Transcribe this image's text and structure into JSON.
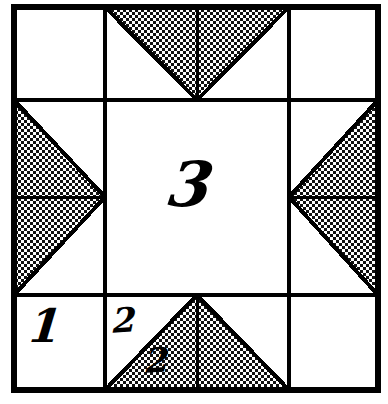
{
  "figure": {
    "block_name": "Ohio Star",
    "ink_color": "#000000",
    "background_color": "#ffffff",
    "fabric_shade_color": "#d9d9d9",
    "outline_width_px": 5,
    "grid_line_width_px": 3,
    "block_bounds": {
      "x": 14,
      "y": 7,
      "width": 364,
      "height": 383
    },
    "grid": {
      "columns_x": [
        14,
        105,
        289,
        378
      ],
      "rows_y": [
        7,
        100,
        295,
        390
      ],
      "column_count": 3,
      "row_count": 3
    }
  },
  "labels": [
    {
      "id": "piece-1",
      "text": "1",
      "cell": "bottom-left-corner-square",
      "shaded": false
    },
    {
      "id": "piece-2-light",
      "text": "2",
      "cell": "bottom-geese-left-light-triangle",
      "shaded": false
    },
    {
      "id": "piece-2-dark",
      "text": "2",
      "cell": "bottom-geese-left-dark-triangle",
      "shaded": true
    },
    {
      "id": "piece-3",
      "text": "3",
      "cell": "center-square",
      "shaded": false
    }
  ],
  "cells": [
    {
      "id": "corner-top-left",
      "type": "plain-square",
      "shaded": false,
      "row": 1,
      "col": 1
    },
    {
      "id": "geese-top",
      "type": "flying-geese",
      "point_direction": "down",
      "triangles": 2,
      "shaded": true,
      "row": 1,
      "col": 2
    },
    {
      "id": "corner-top-right",
      "type": "plain-square",
      "shaded": false,
      "row": 1,
      "col": 3
    },
    {
      "id": "geese-left",
      "type": "flying-geese",
      "point_direction": "right",
      "triangles": 2,
      "shaded": true,
      "row": 2,
      "col": 1
    },
    {
      "id": "center-square",
      "type": "plain-square",
      "shaded": false,
      "row": 2,
      "col": 2
    },
    {
      "id": "geese-right",
      "type": "flying-geese",
      "point_direction": "left",
      "triangles": 2,
      "shaded": true,
      "row": 2,
      "col": 3
    },
    {
      "id": "corner-bottom-left",
      "type": "plain-square",
      "shaded": false,
      "row": 3,
      "col": 1
    },
    {
      "id": "geese-bottom",
      "type": "flying-geese",
      "point_direction": "up",
      "triangles": 2,
      "shaded": true,
      "row": 3,
      "col": 2
    },
    {
      "id": "corner-bottom-right",
      "type": "plain-square",
      "shaded": false,
      "row": 3,
      "col": 3
    }
  ]
}
